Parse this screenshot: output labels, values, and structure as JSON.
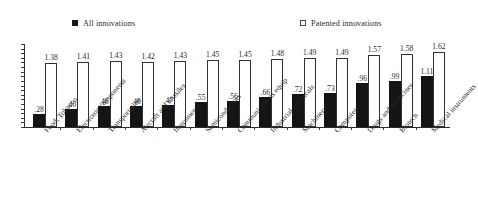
{
  "legend": {
    "all_label": "All innovations",
    "all_icon": "filled-square-icon",
    "patented_label": "Patented innovations",
    "patented_icon": "hollow-square-icon",
    "all_color": "#141414",
    "patented_color": "#ffffff"
  },
  "chart_data": {
    "type": "bar",
    "title": "",
    "subtitle": "",
    "xlabel": "",
    "ylabel": "",
    "ylim": [
      0,
      1.8
    ],
    "grid": false,
    "legend_position": "top",
    "orientation": "vertical",
    "grouping": "grouped",
    "categories": [
      "Food, Tobacco",
      "Electronic components",
      "Transportation",
      "Aircraft and missiles",
      "Instruments",
      "Semiconductors",
      "Communications equip",
      "Industrial chemicals",
      "Machinery",
      "Computers",
      "Drugs and medicines",
      "Biotech",
      "Medical instruments"
    ],
    "series": [
      {
        "name": "All innovations",
        "color": "#141414",
        "values": [
          0.28,
          0.4,
          0.46,
          0.46,
          0.47,
          0.55,
          0.56,
          0.66,
          0.72,
          0.73,
          0.96,
          0.99,
          1.11
        ],
        "labels": [
          ".28",
          ".40",
          ".46",
          ".46",
          ".47",
          ".55",
          ".56",
          ".66",
          ".72",
          ".73",
          ".96",
          ".99",
          "1.11"
        ]
      },
      {
        "name": "Patented innovations",
        "color": "#ffffff",
        "values": [
          1.38,
          1.41,
          1.43,
          1.42,
          1.43,
          1.45,
          1.45,
          1.48,
          1.49,
          1.49,
          1.57,
          1.58,
          1.62
        ],
        "labels": [
          "1.38",
          "1.41",
          "1.43",
          "1.42",
          "1.43",
          "1.45",
          "1.45",
          "1.48",
          "1.49",
          "1.49",
          "1.57",
          "1.58",
          "1.62"
        ]
      }
    ],
    "y_axis": {
      "tick_labels": [],
      "tick_count": 19,
      "min": 0,
      "max": 1.8
    }
  }
}
